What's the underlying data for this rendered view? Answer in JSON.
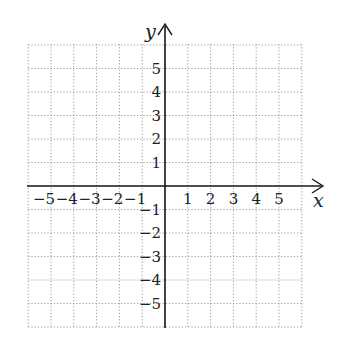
{
  "chart_data": {
    "type": "scatter",
    "title": "",
    "xlabel": "x",
    "ylabel": "y",
    "xlim": [
      -6,
      6
    ],
    "ylim": [
      -6,
      6
    ],
    "grid": true,
    "grid_style": "dotted",
    "x_tick_labels": [
      "-5",
      "-4",
      "-3",
      "-2",
      "-1",
      "1",
      "2",
      "3",
      "4",
      "5"
    ],
    "y_tick_labels": [
      "5",
      "4",
      "3",
      "2",
      "1",
      "-1",
      "-2",
      "-3",
      "-4",
      "-5"
    ],
    "series": [],
    "legend": null
  },
  "labels": {
    "x_axis": "x",
    "y_axis": "y",
    "x_ticks": [
      {
        "value": -5,
        "text": "−5"
      },
      {
        "value": -4,
        "text": "−4"
      },
      {
        "value": -3,
        "text": "−3"
      },
      {
        "value": -2,
        "text": "−2"
      },
      {
        "value": -1,
        "text": "−1"
      },
      {
        "value": 1,
        "text": "1"
      },
      {
        "value": 2,
        "text": "2"
      },
      {
        "value": 3,
        "text": "3"
      },
      {
        "value": 4,
        "text": "4"
      },
      {
        "value": 5,
        "text": "5"
      }
    ],
    "y_ticks": [
      {
        "value": 5,
        "text": "5"
      },
      {
        "value": 4,
        "text": "4"
      },
      {
        "value": 3,
        "text": "3"
      },
      {
        "value": 2,
        "text": "2"
      },
      {
        "value": 1,
        "text": "1"
      },
      {
        "value": -1,
        "text": "−1"
      },
      {
        "value": -2,
        "text": "−2"
      },
      {
        "value": -3,
        "text": "−3"
      },
      {
        "value": -4,
        "text": "−4"
      },
      {
        "value": -5,
        "text": "−5"
      }
    ]
  },
  "colors": {
    "axis": "#1a1a1a",
    "grid": "#9a9a9a",
    "text": "#222222"
  }
}
